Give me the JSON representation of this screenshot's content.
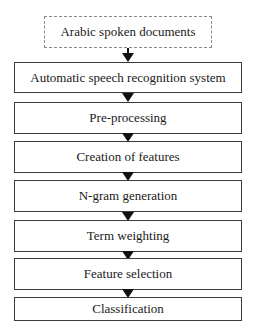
{
  "diagram": {
    "type": "flowchart",
    "direction": "top-to-bottom",
    "input": {
      "label": "Arabic spoken documents",
      "style": "dashed"
    },
    "steps": [
      {
        "label": "Automatic speech recognition system"
      },
      {
        "label": "Pre-processing"
      },
      {
        "label": "Creation of features"
      },
      {
        "label": "N-gram generation"
      },
      {
        "label": "Term weighting"
      },
      {
        "label": "Feature selection"
      },
      {
        "label": "Classification"
      }
    ],
    "colors": {
      "box_border": "#3a3a3a",
      "dashed_border": "#8a8a8a",
      "arrow": "#111111",
      "text": "#1a1a1a",
      "background": "#ffffff"
    }
  }
}
